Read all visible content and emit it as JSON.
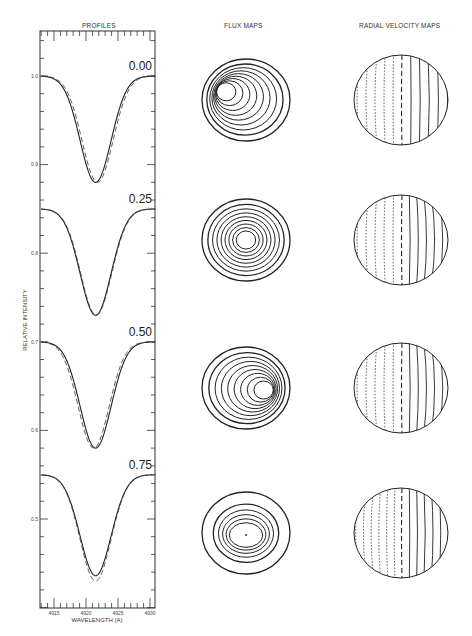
{
  "titles": {
    "profiles": "PROFILES",
    "flux_maps": "FLUX MAPS",
    "rv_maps": "RADIAL VELOCITY MAPS"
  },
  "axes": {
    "xlabel": "WAVELENGTH (A)",
    "ylabel": "RELATIVE INTENSITY",
    "xticks": [
      "4915",
      "4920",
      "4925",
      "4930"
    ],
    "yticks": [
      "1.0",
      "0.9",
      "0.8",
      "0.7",
      "0.6",
      "0.5"
    ]
  },
  "phases": [
    "0.00",
    "0.25",
    "0.50",
    "0.75"
  ],
  "chart_data": [
    {
      "type": "line",
      "title": "PROFILES",
      "xlabel": "WAVELENGTH (A)",
      "ylabel": "RELATIVE INTENSITY",
      "xlim": [
        4913,
        4931
      ],
      "ylim": [
        0.41,
        1.05
      ],
      "xticks": [
        4915,
        4920,
        4925,
        4930
      ],
      "yticks": [
        1.0,
        0.9,
        0.8,
        0.7,
        0.6,
        0.5
      ],
      "legend": [
        "solid: observed/model A",
        "dashed: model B"
      ],
      "series": [
        {
          "phase": "0.00",
          "continuum": 1.0,
          "minimum": 0.88,
          "center": 4921.5,
          "dashed_offset": 0.3,
          "dashed_minimum": 0.88
        },
        {
          "phase": "0.25",
          "continuum": 0.85,
          "minimum": 0.73,
          "center": 4921.5,
          "dashed_offset": 0.1,
          "dashed_minimum": 0.73
        },
        {
          "phase": "0.50",
          "continuum": 0.7,
          "minimum": 0.58,
          "center": 4921.5,
          "dashed_offset": -0.3,
          "dashed_minimum": 0.58
        },
        {
          "phase": "0.75",
          "continuum": 0.55,
          "minimum": 0.436,
          "center": 4921.5,
          "dashed_offset": 0.0,
          "dashed_minimum": 0.43
        }
      ]
    },
    {
      "type": "contour",
      "title": "FLUX MAPS",
      "maps": [
        {
          "phase": "0.00",
          "contours": 9,
          "peak_offset": [
            -0.45,
            -0.2
          ]
        },
        {
          "phase": "0.25",
          "contours": 9,
          "peak_offset": [
            0.0,
            0.0
          ]
        },
        {
          "phase": "0.50",
          "contours": 9,
          "peak_offset": [
            0.4,
            0.05
          ]
        },
        {
          "phase": "0.75",
          "contours": 6,
          "peak_offset": [
            0.0,
            0.05
          ]
        }
      ]
    },
    {
      "type": "contour",
      "title": "RADIAL VELOCITY MAPS",
      "maps": [
        {
          "phase": "0.00",
          "negative_contours": 5,
          "zero_line": "dashed",
          "positive_contours": 5
        },
        {
          "phase": "0.25",
          "negative_contours": 5,
          "zero_line": "dashed",
          "positive_contours": 6
        },
        {
          "phase": "0.50",
          "negative_contours": 5,
          "zero_line": "dashed",
          "positive_contours": 6
        },
        {
          "phase": "0.75",
          "negative_contours": 6,
          "zero_line": "dashed",
          "positive_contours": 6
        }
      ]
    }
  ]
}
